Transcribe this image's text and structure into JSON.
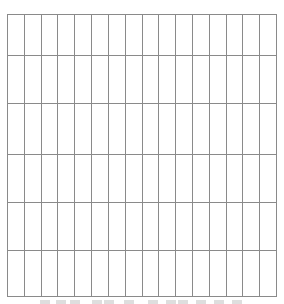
{
  "grid": {
    "columns": 16,
    "rows": 6,
    "border_color": "#8a8a8a",
    "background": "#ffffff",
    "cells": []
  },
  "caption": {
    "visible": "clipped",
    "text": ""
  }
}
